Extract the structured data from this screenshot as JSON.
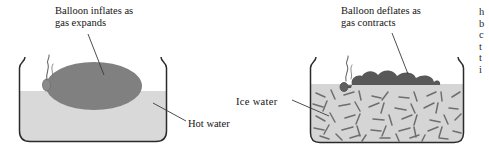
{
  "figure": {
    "colors": {
      "water": "#d9d9d9",
      "ice_water": "#d5d5d5",
      "inflated_balloon": "#808080",
      "deflated_balloon": "#585858",
      "ice_chip": "#6e6e6e",
      "beaker_outline": "#2b2b2b",
      "leader_line": "#3a3a3a",
      "text": "#141414",
      "background": "#ffffff"
    },
    "panels": [
      {
        "id": "hot-water-panel",
        "callout": "Balloon inflates as\ngas expands",
        "callout_line1": "Balloon inflates as",
        "callout_line2": "gas expands",
        "liquid_label": "Hot water",
        "balloon_state": "inflated",
        "beaker": {
          "x": 18,
          "y": 57,
          "width": 150,
          "height": 86
        },
        "water_level_y": 91
      },
      {
        "id": "ice-water-panel",
        "callout": "Balloon deflates as\ngas contracts",
        "callout_line1": "Balloon deflates as",
        "callout_line2": "gas contracts",
        "liquid_label": "Ice water",
        "balloon_state": "deflated",
        "beaker": {
          "x": 308,
          "y": 57,
          "width": 157,
          "height": 86
        },
        "water_level_y": 84
      }
    ]
  },
  "cutoff_column": {
    "note": "partial body text clipped at right page edge",
    "lines": "h\nb\nc\nt\nt\ni"
  }
}
